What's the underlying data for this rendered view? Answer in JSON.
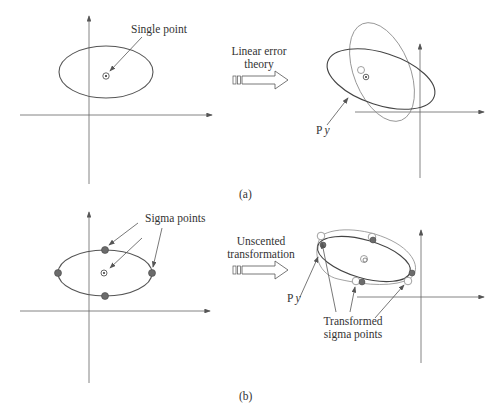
{
  "panel_a": {
    "caption": "(a)",
    "input_label": "Single point",
    "transform_label_line1": "Linear error",
    "transform_label_line2": "theory",
    "output_label_prefix": "P",
    "output_label_suffix": "y"
  },
  "panel_b": {
    "caption": "(b)",
    "input_label": "Sigma points",
    "transform_label_line1": "Unscented",
    "transform_label_line2": "transformation",
    "output_label_prefix": "P",
    "output_label_suffix": "y",
    "transformed_label_line1": "Transformed",
    "transformed_label_line2": "sigma points"
  },
  "colors": {
    "ellipse": "#555555",
    "ellipse_light": "#8a8a8a",
    "axis": "#666666",
    "sigma_point_fill": "#6b6b6b",
    "text": "#333333"
  }
}
